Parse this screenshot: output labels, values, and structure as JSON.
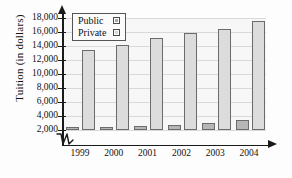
{
  "chart_data": {
    "type": "bar",
    "title": "",
    "xlabel": "",
    "ylabel": "Tuition (in dollars)",
    "categories": [
      "1999",
      "2000",
      "2001",
      "2002",
      "2003",
      "2004"
    ],
    "series": [
      {
        "name": "Public",
        "color": "#b6b6b6",
        "values": [
          2400,
          2500,
          2600,
          2750,
          3000,
          3450
        ]
      },
      {
        "name": "Private",
        "color": "#dcdcdc",
        "values": [
          13400,
          14100,
          15100,
          15900,
          16500,
          17600
        ]
      }
    ],
    "ylim": [
      2000,
      18000
    ],
    "ytick_labels": [
      "18,000",
      "16,000",
      "14,000",
      "12,000",
      "10,000",
      "8,000",
      "6,000",
      "4,000",
      "2,000"
    ],
    "ytick_values": [
      18000,
      16000,
      14000,
      12000,
      10000,
      8000,
      6000,
      4000,
      2000
    ],
    "grid": true,
    "axis_break": true,
    "legend_position": "top-left",
    "legend_entries": [
      {
        "label": "Public",
        "swatch": "public-swatch-icon"
      },
      {
        "label": "Private",
        "swatch": "private-swatch-icon"
      }
    ]
  }
}
